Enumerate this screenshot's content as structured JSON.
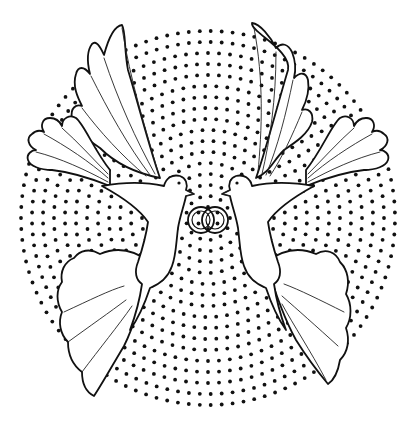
{
  "illustration": {
    "subject": "two doves holding interlocked wedding rings",
    "style": "black line art coloring page",
    "background_pattern": "concentric rings of dots",
    "colors": {
      "background": "#ffffff",
      "ink": "#111111"
    },
    "circle": {
      "cx": 208,
      "cy": 218,
      "r": 192,
      "ring_spacing": 11,
      "dot_spacing": 11,
      "dot_radius": 1.9
    },
    "elements": [
      "left-upper-wing",
      "right-upper-wing",
      "left-tail-fan",
      "right-tail-fan",
      "left-lower-wing",
      "right-lower-wing",
      "left-dove",
      "right-dove",
      "wedding-rings"
    ]
  }
}
